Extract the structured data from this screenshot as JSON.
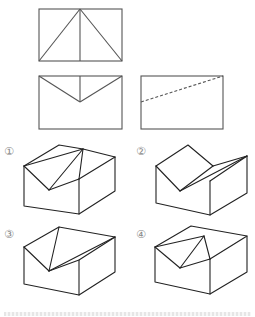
{
  "problem": {
    "type": "three-view to isometric matching",
    "views": {
      "top_view": {
        "rect": [
          39,
          9,
          122,
          61
        ],
        "lines": [
          [
            [
              80,
              9
            ],
            [
              39,
              61
            ]
          ],
          [
            [
              80,
              9
            ],
            [
              122,
              61
            ]
          ],
          [
            [
              80,
              9
            ],
            [
              80,
              61
            ]
          ]
        ]
      },
      "front_view": {
        "rect": [
          39,
          76,
          122,
          129
        ],
        "lines": [
          [
            [
              39,
              76
            ],
            [
              80,
              102
            ]
          ],
          [
            [
              122,
              76
            ],
            [
              80,
              102
            ]
          ],
          [
            [
              80,
              76
            ],
            [
              80,
              102
            ]
          ]
        ]
      },
      "side_view": {
        "rect": [
          141,
          76,
          223,
          129
        ],
        "hidden_lines": [
          [
            [
              141,
              102
            ],
            [
              223,
              76
            ]
          ]
        ]
      }
    },
    "options": [
      {
        "label": "①",
        "label_pos": [
          8,
          154
        ]
      },
      {
        "label": "②",
        "label_pos": [
          140,
          154
        ]
      },
      {
        "label": "③",
        "label_pos": [
          8,
          237
        ]
      },
      {
        "label": "④",
        "label_pos": [
          140,
          237
        ]
      }
    ],
    "colors": {
      "line": "#222222",
      "view_line": "#555555",
      "label": "#888888"
    }
  }
}
